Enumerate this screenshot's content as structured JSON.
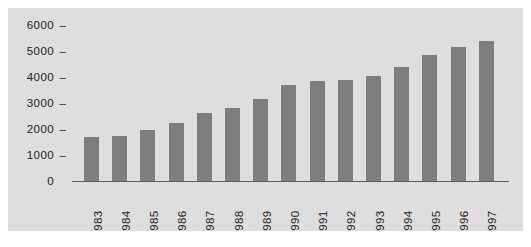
{
  "chart_data": {
    "type": "bar",
    "title": "",
    "subtitle": "",
    "xlabel": "",
    "ylabel": "",
    "categories": [
      "1983",
      "1984",
      "1985",
      "1986",
      "1987",
      "1988",
      "1989",
      "1990",
      "1991",
      "1992",
      "1993",
      "1994",
      "1995",
      "1996",
      "1997"
    ],
    "values": [
      1700,
      1750,
      1950,
      2250,
      2600,
      2800,
      3150,
      3700,
      3850,
      3900,
      4050,
      4400,
      4850,
      5150,
      5400
    ],
    "ylim": [
      0,
      6000
    ],
    "yticks": [
      0,
      1000,
      2000,
      3000,
      4000,
      5000,
      6000
    ],
    "ytick_labels": [
      "0",
      "1000",
      "2000",
      "3000",
      "4000",
      "5000",
      "6000"
    ],
    "grid": false,
    "legend": null,
    "legend_position": "none",
    "series": [
      {
        "name": "",
        "values": [
          1700,
          1750,
          1950,
          2250,
          2600,
          2800,
          3150,
          3700,
          3850,
          3900,
          4050,
          4400,
          4850,
          5150,
          5400
        ]
      }
    ],
    "tick_marker": "–",
    "colors": {
      "bar": "#7e7e7e",
      "background": "#dedede",
      "page": "#ffffff",
      "axis": "#5d5d5d",
      "text": "#222222"
    }
  }
}
